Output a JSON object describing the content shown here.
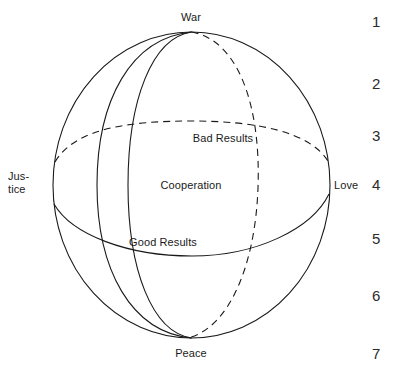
{
  "diagram": {
    "background_color": "#ffffff",
    "stroke_color": "#1a1a1a",
    "labels": {
      "top": "War",
      "bottom": "Peace",
      "left_line1": "Jus-",
      "left_line2": "tice",
      "right": "Love",
      "upper_band": "Bad Results",
      "center": "Cooperation",
      "lower_band": "Good Results"
    },
    "scale": {
      "name": "seven-point-scale",
      "values": [
        "1",
        "2",
        "3",
        "4",
        "5",
        "6",
        "7"
      ]
    }
  }
}
